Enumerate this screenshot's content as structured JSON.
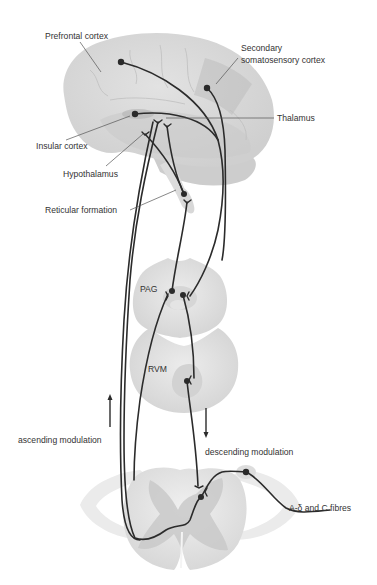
{
  "figure": {
    "colors": {
      "background": "#ffffff",
      "tissue_light": "#e6e6e6",
      "tissue_mid": "#d2d2d2",
      "tissue_dark": "#bdbdbd",
      "nerve": "#2b2b2b",
      "label_text": "#333333"
    }
  },
  "labels": {
    "prefrontal_cortex": "Prefrontal cortex",
    "secondary_line1": "Secondary",
    "secondary_line2": "somatosensory cortex",
    "thalamus": "Thalamus",
    "insular_cortex": "Insular cortex",
    "hypothalamus": "Hypothalamus",
    "reticular_formation": "Reticular formation",
    "pag": "PAG",
    "rvm": "RVM",
    "ascending_modulation": "ascending modulation",
    "descending_modulation": "descending modulation",
    "afferent_fibres": "A-δ and C fibres"
  },
  "structures": [
    {
      "name": "brain",
      "label_key": "none"
    },
    {
      "name": "midbrain-pag",
      "label_key": "pag"
    },
    {
      "name": "medulla-rvm",
      "label_key": "rvm"
    },
    {
      "name": "spinal-cord",
      "label_key": "none"
    }
  ],
  "arrows": [
    {
      "name": "ascending-arrow",
      "direction": "up"
    },
    {
      "name": "descending-arrow",
      "direction": "down"
    }
  ]
}
